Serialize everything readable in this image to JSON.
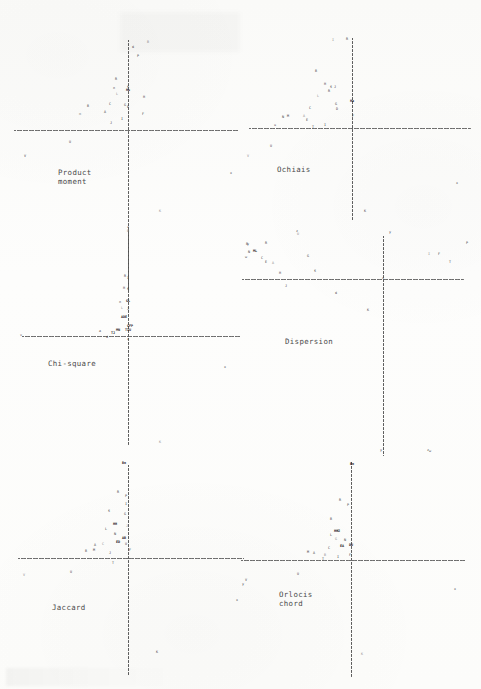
{
  "document": {
    "kind": "scanned-figure-page",
    "background_color": "#fdfdfc",
    "ink_color": "#3a3a3a",
    "axis_color": "#5a5a5a",
    "width": 481,
    "height": 689
  },
  "panels": [
    {
      "id": "product-moment",
      "label": "Product\nmoment",
      "label_x": 58,
      "label_y": 168,
      "origin_x": 128,
      "origin_y": 130,
      "axis_h": {
        "x": 14,
        "y": 130,
        "width": 224
      },
      "axis_v": {
        "x": 128,
        "y": 40,
        "height": 250
      }
    },
    {
      "id": "ochiais",
      "label": "Ochiais",
      "label_x": 277,
      "label_y": 165,
      "origin_x": 352,
      "origin_y": 128,
      "axis_h": {
        "x": 249,
        "y": 128,
        "width": 222
      },
      "axis_v": {
        "x": 352,
        "y": 38,
        "height": 182
      }
    },
    {
      "id": "chi-square",
      "label": "Chi-square",
      "label_x": 48,
      "label_y": 359,
      "origin_x": 128,
      "origin_y": 336,
      "axis_h": {
        "x": 22,
        "y": 336,
        "width": 218
      },
      "axis_v": {
        "x": 128,
        "y": 230,
        "height": 215
      }
    },
    {
      "id": "dispersion",
      "label": "Dispersion",
      "label_x": 285,
      "label_y": 337,
      "origin_x": 383,
      "origin_y": 279,
      "axis_h": {
        "x": 242,
        "y": 279,
        "width": 222
      },
      "axis_v": {
        "x": 383,
        "y": 236,
        "height": 220
      }
    },
    {
      "id": "jaccard",
      "label": "Jaccard",
      "label_x": 52,
      "label_y": 603,
      "origin_x": 128,
      "origin_y": 558,
      "axis_h": {
        "x": 18,
        "y": 558,
        "width": 226
      },
      "axis_v": {
        "x": 128,
        "y": 465,
        "height": 210
      }
    },
    {
      "id": "orlocis-chord",
      "label": "Orlocis\nchord",
      "label_x": 279,
      "label_y": 590,
      "origin_x": 351,
      "origin_y": 560,
      "axis_h": {
        "x": 241,
        "y": 560,
        "width": 224
      },
      "axis_v": {
        "x": 351,
        "y": 462,
        "height": 215
      }
    }
  ],
  "chart_data": {
    "type": "scatter",
    "title": "",
    "xlabel": "",
    "ylabel": "",
    "grid": false,
    "legend": "none",
    "note": "Six ordination scatter panels; each point is a labelled letter glyph plotted against dotted zero axes.",
    "panels": [
      {
        "name": "Product moment",
        "points": [
          {
            "x": 148,
            "y": 43,
            "m": "B"
          },
          {
            "x": 133,
            "y": 48,
            "m": "d"
          },
          {
            "x": 138,
            "y": 57,
            "m": "P"
          },
          {
            "x": 116,
            "y": 80,
            "m": "R"
          },
          {
            "x": 114,
            "y": 89,
            "m": "n"
          },
          {
            "x": 128,
            "y": 88,
            "m": "S"
          },
          {
            "x": 128,
            "y": 91,
            "m": "Hu"
          },
          {
            "x": 117,
            "y": 95,
            "m": "L"
          },
          {
            "x": 144,
            "y": 98,
            "m": "H"
          },
          {
            "x": 110,
            "y": 105,
            "m": "C"
          },
          {
            "x": 88,
            "y": 107,
            "m": "B"
          },
          {
            "x": 125,
            "y": 106,
            "m": "G"
          },
          {
            "x": 128,
            "y": 108,
            "m": "E"
          },
          {
            "x": 105,
            "y": 113,
            "m": "A"
          },
          {
            "x": 80,
            "y": 115,
            "m": "m"
          },
          {
            "x": 143,
            "y": 115,
            "m": "F"
          },
          {
            "x": 122,
            "y": 120,
            "m": "I"
          },
          {
            "x": 111,
            "y": 124,
            "m": "J"
          },
          {
            "x": 70,
            "y": 143,
            "m": "U"
          },
          {
            "x": 25,
            "y": 157,
            "m": "V"
          },
          {
            "x": 231,
            "y": 174,
            "m": "x"
          },
          {
            "x": 160,
            "y": 212,
            "m": "K"
          },
          {
            "x": 128,
            "y": 228,
            "m": "z"
          }
        ]
      },
      {
        "name": "Ochiais",
        "points": [
          {
            "x": 333,
            "y": 41,
            "m": "I"
          },
          {
            "x": 347,
            "y": 40,
            "m": "R"
          },
          {
            "x": 316,
            "y": 72,
            "m": "B"
          },
          {
            "x": 325,
            "y": 85,
            "m": "H"
          },
          {
            "x": 331,
            "y": 88,
            "m": "S"
          },
          {
            "x": 335,
            "y": 88,
            "m": "J"
          },
          {
            "x": 329,
            "y": 92,
            "m": "R"
          },
          {
            "x": 318,
            "y": 97,
            "m": "L"
          },
          {
            "x": 336,
            "y": 105,
            "m": "G"
          },
          {
            "x": 310,
            "y": 109,
            "m": "C"
          },
          {
            "x": 337,
            "y": 110,
            "m": "D"
          },
          {
            "x": 352,
            "y": 102,
            "m": "Ha"
          },
          {
            "x": 288,
            "y": 117,
            "m": "M"
          },
          {
            "x": 283,
            "y": 118,
            "m": "N"
          },
          {
            "x": 304,
            "y": 117,
            "m": "A"
          },
          {
            "x": 307,
            "y": 121,
            "m": "E"
          },
          {
            "x": 353,
            "y": 117,
            "m": "F"
          },
          {
            "x": 275,
            "y": 126,
            "m": "u"
          },
          {
            "x": 325,
            "y": 126,
            "m": "I"
          },
          {
            "x": 313,
            "y": 128,
            "m": "T"
          },
          {
            "x": 271,
            "y": 147,
            "m": "U"
          },
          {
            "x": 248,
            "y": 157,
            "m": "V"
          },
          {
            "x": 457,
            "y": 184,
            "m": "x"
          },
          {
            "x": 365,
            "y": 212,
            "m": "K"
          },
          {
            "x": 297,
            "y": 232,
            "m": "z"
          },
          {
            "x": 390,
            "y": 233,
            "m": "y"
          }
        ]
      },
      {
        "name": "Chi-square",
        "points": [
          {
            "x": 128,
            "y": 232,
            "m": "B"
          },
          {
            "x": 125,
            "y": 277,
            "m": "R"
          },
          {
            "x": 128,
            "y": 279,
            "m": "I"
          },
          {
            "x": 124,
            "y": 289,
            "m": "H"
          },
          {
            "x": 128,
            "y": 290,
            "m": "S"
          },
          {
            "x": 120,
            "y": 303,
            "m": "n"
          },
          {
            "x": 128,
            "y": 302,
            "m": "GL"
          },
          {
            "x": 122,
            "y": 309,
            "m": "L"
          },
          {
            "x": 128,
            "y": 310,
            "m": "J"
          },
          {
            "x": 124,
            "y": 318,
            "m": "ADE"
          },
          {
            "x": 130,
            "y": 327,
            "m": "CFP"
          },
          {
            "x": 118,
            "y": 331,
            "m": "MN"
          },
          {
            "x": 128,
            "y": 331,
            "m": "TIU"
          },
          {
            "x": 100,
            "y": 332,
            "m": "a"
          },
          {
            "x": 113,
            "y": 334,
            "m": "TJ"
          },
          {
            "x": 107,
            "y": 338,
            "m": "d"
          },
          {
            "x": 128,
            "y": 340,
            "m": "z"
          },
          {
            "x": 21,
            "y": 336,
            "m": "v"
          },
          {
            "x": 225,
            "y": 368,
            "m": "x"
          },
          {
            "x": 248,
            "y": 245,
            "m": "y"
          },
          {
            "x": 246,
            "y": 258,
            "m": "w"
          },
          {
            "x": 160,
            "y": 443,
            "m": "K"
          }
        ]
      },
      {
        "name": "Dispersion",
        "points": [
          {
            "x": 298,
            "y": 235,
            "m": "U"
          },
          {
            "x": 247,
            "y": 245,
            "m": "B"
          },
          {
            "x": 266,
            "y": 244,
            "m": "R"
          },
          {
            "x": 249,
            "y": 253,
            "m": "N"
          },
          {
            "x": 255,
            "y": 252,
            "m": "ML"
          },
          {
            "x": 262,
            "y": 259,
            "m": "C"
          },
          {
            "x": 266,
            "y": 263,
            "m": "E"
          },
          {
            "x": 273,
            "y": 264,
            "m": "A"
          },
          {
            "x": 308,
            "y": 257,
            "m": "G"
          },
          {
            "x": 280,
            "y": 274,
            "m": "H"
          },
          {
            "x": 315,
            "y": 272,
            "m": "S"
          },
          {
            "x": 286,
            "y": 287,
            "m": "J"
          },
          {
            "x": 336,
            "y": 294,
            "m": "d"
          },
          {
            "x": 368,
            "y": 311,
            "m": "K"
          },
          {
            "x": 429,
            "y": 255,
            "m": "I"
          },
          {
            "x": 439,
            "y": 255,
            "m": "F"
          },
          {
            "x": 467,
            "y": 244,
            "m": "P"
          },
          {
            "x": 450,
            "y": 263,
            "m": "T"
          },
          {
            "x": 428,
            "y": 451,
            "m": "z"
          },
          {
            "x": 383,
            "y": 279,
            "m": "x"
          }
        ]
      },
      {
        "name": "Jaccard",
        "points": [
          {
            "x": 124,
            "y": 464,
            "m": "Bo"
          },
          {
            "x": 118,
            "y": 493,
            "m": "R"
          },
          {
            "x": 126,
            "y": 497,
            "m": "P"
          },
          {
            "x": 126,
            "y": 505,
            "m": "I"
          },
          {
            "x": 109,
            "y": 512,
            "m": "S"
          },
          {
            "x": 125,
            "y": 515,
            "m": "G"
          },
          {
            "x": 115,
            "y": 525,
            "m": "HH"
          },
          {
            "x": 127,
            "y": 527,
            "m": "J"
          },
          {
            "x": 106,
            "y": 530,
            "m": "L"
          },
          {
            "x": 115,
            "y": 535,
            "m": "N"
          },
          {
            "x": 124,
            "y": 539,
            "m": "AB"
          },
          {
            "x": 118,
            "y": 543,
            "m": "ED"
          },
          {
            "x": 126,
            "y": 545,
            "m": "U"
          },
          {
            "x": 95,
            "y": 546,
            "m": "A"
          },
          {
            "x": 103,
            "y": 545,
            "m": "C"
          },
          {
            "x": 94,
            "y": 551,
            "m": "M"
          },
          {
            "x": 86,
            "y": 552,
            "m": "B"
          },
          {
            "x": 110,
            "y": 554,
            "m": "J"
          },
          {
            "x": 130,
            "y": 551,
            "m": "F"
          },
          {
            "x": 113,
            "y": 564,
            "m": "T"
          },
          {
            "x": 71,
            "y": 573,
            "m": "U"
          },
          {
            "x": 24,
            "y": 576,
            "m": "V"
          },
          {
            "x": 243,
            "y": 585,
            "m": "y"
          },
          {
            "x": 237,
            "y": 601,
            "m": "x"
          },
          {
            "x": 157,
            "y": 653,
            "m": "K"
          }
        ]
      },
      {
        "name": "Orlocis chord",
        "points": [
          {
            "x": 352,
            "y": 465,
            "m": "Bo"
          },
          {
            "x": 340,
            "y": 501,
            "m": "R"
          },
          {
            "x": 348,
            "y": 506,
            "m": "P"
          },
          {
            "x": 331,
            "y": 520,
            "m": "B"
          },
          {
            "x": 337,
            "y": 532,
            "m": "HHJ"
          },
          {
            "x": 338,
            "y": 532,
            "m": "S"
          },
          {
            "x": 331,
            "y": 536,
            "m": "L"
          },
          {
            "x": 336,
            "y": 540,
            "m": "G"
          },
          {
            "x": 345,
            "y": 541,
            "m": "N"
          },
          {
            "x": 342,
            "y": 547,
            "m": "EA"
          },
          {
            "x": 351,
            "y": 546,
            "m": "DU"
          },
          {
            "x": 329,
            "y": 549,
            "m": "C"
          },
          {
            "x": 308,
            "y": 553,
            "m": "M"
          },
          {
            "x": 314,
            "y": 554,
            "m": "A"
          },
          {
            "x": 325,
            "y": 556,
            "m": "B"
          },
          {
            "x": 323,
            "y": 560,
            "m": "T"
          },
          {
            "x": 338,
            "y": 558,
            "m": "I"
          },
          {
            "x": 350,
            "y": 556,
            "m": "F"
          },
          {
            "x": 298,
            "y": 575,
            "m": "U"
          },
          {
            "x": 246,
            "y": 581,
            "m": "V"
          },
          {
            "x": 455,
            "y": 590,
            "m": "x"
          },
          {
            "x": 362,
            "y": 655,
            "m": "K"
          },
          {
            "x": 381,
            "y": 451,
            "m": "y"
          },
          {
            "x": 430,
            "y": 452,
            "m": "w"
          }
        ]
      }
    ]
  }
}
